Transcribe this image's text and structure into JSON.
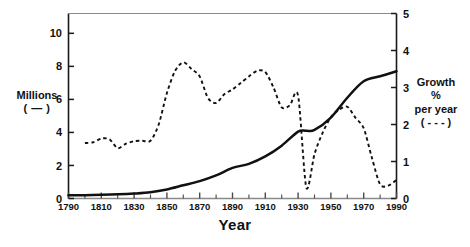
{
  "chart_data": {
    "type": "line",
    "title": "",
    "xlabel": "Year",
    "grid": false,
    "legend_position": "axis-labels",
    "x_axis": {
      "label": "Year",
      "min": 1790,
      "max": 1990,
      "ticks": [
        1790,
        1810,
        1830,
        1850,
        1870,
        1890,
        1910,
        1930,
        1950,
        1970,
        1990
      ],
      "tick_labels": [
        "1790",
        "1810",
        "1830",
        "1850",
        "1870",
        "1890",
        "1910",
        "1930",
        "1950",
        "1970",
        "1990"
      ],
      "minor_tick_step": 10
    },
    "y_axis_left": {
      "label_lines": [
        "Millions",
        "( — )"
      ],
      "label": "Millions ( — )",
      "min": 0,
      "max": 11.2,
      "ticks": [
        0,
        2,
        4,
        6,
        8,
        10
      ],
      "tick_labels": [
        "0",
        "2",
        "4",
        "6",
        "8",
        "10"
      ],
      "series_marker": "solid"
    },
    "y_axis_right": {
      "label_lines": [
        "Growth",
        "%",
        "per year",
        "( - - - )"
      ],
      "label": "Growth % per year ( - - - )",
      "min": 0,
      "max": 5,
      "ticks": [
        0,
        1,
        2,
        3,
        4,
        5
      ],
      "tick_labels": [
        "0",
        "1",
        "2",
        "3",
        "4",
        "5"
      ],
      "series_marker": "dashed"
    },
    "series": [
      {
        "name": "Millions",
        "axis": "left",
        "style": "solid",
        "color": "#111111",
        "x": [
          1790,
          1800,
          1810,
          1820,
          1830,
          1840,
          1850,
          1860,
          1870,
          1880,
          1890,
          1900,
          1910,
          1920,
          1930,
          1935,
          1940,
          1950,
          1960,
          1970,
          1980,
          1990
        ],
        "values": [
          0.2,
          0.2,
          0.22,
          0.25,
          0.3,
          0.38,
          0.55,
          0.8,
          1.05,
          1.4,
          1.85,
          2.1,
          2.55,
          3.2,
          4.05,
          4.1,
          4.15,
          4.9,
          6.1,
          7.1,
          7.4,
          7.7
        ]
      },
      {
        "name": "Growth % per year",
        "axis": "right",
        "style": "dashed",
        "color": "#111111",
        "x": [
          1800,
          1805,
          1810,
          1815,
          1820,
          1825,
          1830,
          1835,
          1840,
          1845,
          1850,
          1855,
          1860,
          1865,
          1870,
          1875,
          1880,
          1885,
          1890,
          1895,
          1900,
          1905,
          1910,
          1915,
          1920,
          1925,
          1930,
          1935,
          1940,
          1945,
          1950,
          1955,
          1960,
          1965,
          1970,
          1975,
          1980,
          1985,
          1990
        ],
        "values": [
          1.5,
          1.52,
          1.62,
          1.6,
          1.36,
          1.48,
          1.55,
          1.56,
          1.56,
          2.0,
          2.85,
          3.45,
          3.68,
          3.5,
          3.3,
          2.72,
          2.58,
          2.82,
          2.95,
          3.12,
          3.3,
          3.45,
          3.42,
          3.0,
          2.46,
          2.52,
          2.78,
          0.3,
          1.2,
          1.78,
          2.2,
          2.4,
          2.48,
          2.18,
          1.9,
          1.1,
          0.38,
          0.35,
          0.5
        ]
      }
    ]
  }
}
